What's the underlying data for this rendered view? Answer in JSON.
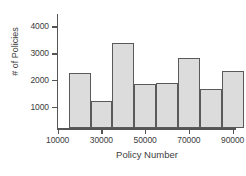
{
  "chart_data": {
    "type": "bar",
    "title": "",
    "subtitle": "",
    "xlabel": "Policy Number",
    "ylabel": "# of Policies",
    "grid": false,
    "legend": null,
    "xlim": [
      10000,
      90000
    ],
    "ylim": [
      200,
      4100
    ],
    "xticks": [
      10000,
      30000,
      50000,
      70000,
      90000
    ],
    "xtick_labels": [
      "10000",
      "30000",
      "50000",
      "70000",
      "90000"
    ],
    "yticks": [
      1000,
      2000,
      3000,
      4000
    ],
    "ytick_labels": [
      "1000",
      "2000",
      "3000",
      "4000"
    ],
    "bin_width": 10000,
    "bin_edges": [
      15000,
      25000,
      35000,
      45000,
      55000,
      65000,
      75000,
      85000,
      95000
    ],
    "categories": [
      "15000-25000",
      "25000-35000",
      "35000-45000",
      "45000-55000",
      "55000-65000",
      "65000-75000",
      "75000-85000",
      "85000-95000"
    ],
    "values": [
      2270,
      1220,
      3400,
      1870,
      1890,
      2830,
      1650,
      2350
    ],
    "bar_fill_color": "#dcdcdc",
    "bar_edge_color": "#5a5a5a",
    "axis_color": "#555555",
    "background_color": "#ffffff"
  }
}
